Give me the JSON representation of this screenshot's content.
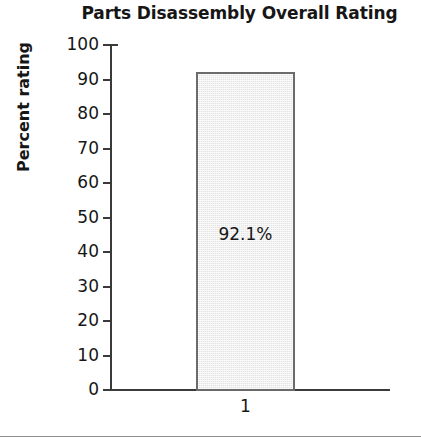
{
  "chart_data": {
    "type": "bar",
    "title": "Parts Disassembly Overall Rating",
    "xlabel": "",
    "ylabel": "Percent rating",
    "categories": [
      "1"
    ],
    "values": [
      92.1
    ],
    "data_labels": [
      "92.1%"
    ],
    "ylim": [
      0,
      100
    ],
    "ytick_labels": [
      "100",
      "90",
      "80",
      "70",
      "60",
      "50",
      "40",
      "30",
      "20",
      "10",
      "0"
    ],
    "ytick_values": [
      100,
      90,
      80,
      70,
      60,
      50,
      40,
      30,
      20,
      10,
      0
    ],
    "grid": false,
    "legend": null,
    "series": [
      {
        "name": "Percent rating",
        "values": [
          92.1
        ],
        "fill_color": "#e3e3e3",
        "border_color": "#6b6b6b"
      }
    ],
    "colors": {
      "axis": "#3a3a3a",
      "text": "#161616",
      "bar_fill": "#e3e3e3",
      "bar_border": "#6b6b6b",
      "rule": "#8f8f8f",
      "background": "#ffffff"
    }
  }
}
